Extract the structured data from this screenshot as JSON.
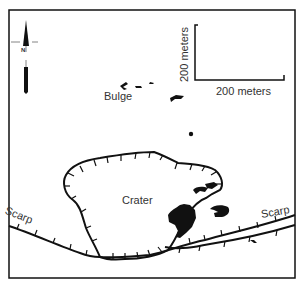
{
  "map": {
    "labels": {
      "bulge": "Bulge",
      "crater": "Crater",
      "scarp_left": "Scarp",
      "scarp_right": "Scarp"
    },
    "scale_bar": {
      "vertical_label": "200 meters",
      "horizontal_label": "200 meters"
    },
    "north_arrow": {
      "label": "N"
    },
    "colors": {
      "ink": "#111111",
      "background": "#ffffff"
    }
  }
}
